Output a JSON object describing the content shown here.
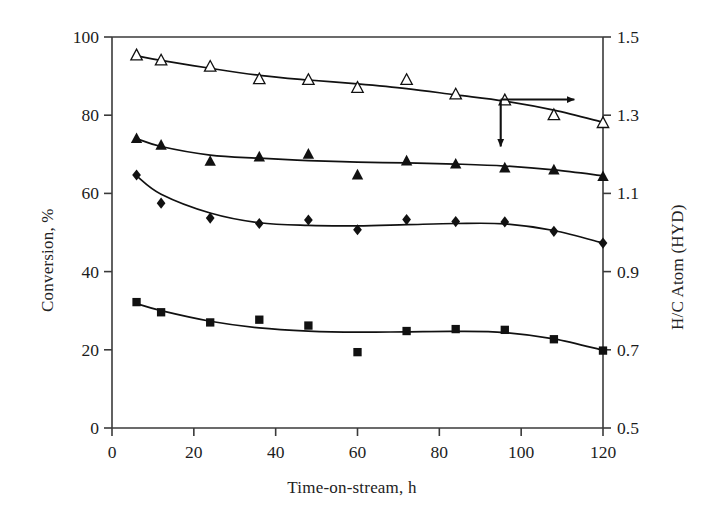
{
  "chart_data": {
    "type": "line",
    "title": "",
    "subtitle": "",
    "xlabel": "Time-on-stream, h",
    "ylabel": "Conversion, %",
    "ylabel_right": "H/C Atom (HYD)",
    "xlim": [
      0,
      120
    ],
    "ylim": [
      0,
      100
    ],
    "ylim_right": [
      0.5,
      1.5
    ],
    "xticks": [
      0,
      20,
      40,
      60,
      80,
      100,
      120
    ],
    "xticklabels": [
      "0",
      "20",
      "40",
      "60",
      "80",
      "100",
      "120"
    ],
    "yticks": [
      0,
      20,
      40,
      60,
      80,
      100
    ],
    "yticklabels": [
      "0",
      "20",
      "40",
      "60",
      "80",
      "100"
    ],
    "yticks_right": [
      0.5,
      0.7,
      0.9,
      1.1,
      1.3,
      1.5
    ],
    "yticklabels_right": [
      "0.5",
      "0.7",
      "0.9",
      "1.1",
      "1.3",
      "1.5"
    ],
    "grid": false,
    "legend": "none",
    "legend_position": "none",
    "axis_color": "#3a3a3a",
    "series_color": "#111111",
    "series": [
      {
        "name": "open-triangle",
        "marker": "triangle-open",
        "axis": "right",
        "points": [
          {
            "x": 6,
            "y": 95.3
          },
          {
            "x": 12,
            "y": 94.0
          },
          {
            "x": 24,
            "y": 92.4
          },
          {
            "x": 36,
            "y": 89.2
          },
          {
            "x": 48,
            "y": 89.0
          },
          {
            "x": 60,
            "y": 87.0
          },
          {
            "x": 72,
            "y": 89.0
          },
          {
            "x": 84,
            "y": 85.3
          },
          {
            "x": 96,
            "y": 83.8
          },
          {
            "x": 108,
            "y": 80.0
          },
          {
            "x": 120,
            "y": 78.0
          }
        ],
        "fit_curve": [
          {
            "x": 6,
            "y": 95.2
          },
          {
            "x": 12,
            "y": 94.0
          },
          {
            "x": 24,
            "y": 92.0
          },
          {
            "x": 36,
            "y": 90.2
          },
          {
            "x": 48,
            "y": 89.0
          },
          {
            "x": 60,
            "y": 88.0
          },
          {
            "x": 72,
            "y": 86.8
          },
          {
            "x": 84,
            "y": 85.2
          },
          {
            "x": 96,
            "y": 83.6
          },
          {
            "x": 108,
            "y": 81.3
          },
          {
            "x": 120,
            "y": 78.2
          }
        ]
      },
      {
        "name": "filled-triangle",
        "marker": "triangle-filled",
        "axis": "left",
        "points": [
          {
            "x": 6,
            "y": 74.0
          },
          {
            "x": 12,
            "y": 72.3
          },
          {
            "x": 24,
            "y": 68.2
          },
          {
            "x": 36,
            "y": 69.3
          },
          {
            "x": 48,
            "y": 70.0
          },
          {
            "x": 60,
            "y": 64.7
          },
          {
            "x": 72,
            "y": 68.3
          },
          {
            "x": 84,
            "y": 67.5
          },
          {
            "x": 96,
            "y": 66.5
          },
          {
            "x": 108,
            "y": 66.0
          },
          {
            "x": 120,
            "y": 64.3
          }
        ],
        "fit_curve": [
          {
            "x": 6,
            "y": 74.0
          },
          {
            "x": 12,
            "y": 72.0
          },
          {
            "x": 24,
            "y": 69.8
          },
          {
            "x": 36,
            "y": 69.0
          },
          {
            "x": 48,
            "y": 68.4
          },
          {
            "x": 60,
            "y": 68.0
          },
          {
            "x": 72,
            "y": 67.8
          },
          {
            "x": 84,
            "y": 67.5
          },
          {
            "x": 96,
            "y": 67.0
          },
          {
            "x": 108,
            "y": 66.0
          },
          {
            "x": 120,
            "y": 64.5
          }
        ]
      },
      {
        "name": "filled-diamond",
        "marker": "diamond-filled",
        "axis": "left",
        "points": [
          {
            "x": 6,
            "y": 64.7
          },
          {
            "x": 12,
            "y": 57.5
          },
          {
            "x": 24,
            "y": 53.7
          },
          {
            "x": 36,
            "y": 52.3
          },
          {
            "x": 48,
            "y": 53.2
          },
          {
            "x": 60,
            "y": 50.7
          },
          {
            "x": 72,
            "y": 53.3
          },
          {
            "x": 84,
            "y": 52.8
          },
          {
            "x": 96,
            "y": 52.7
          },
          {
            "x": 108,
            "y": 50.3
          },
          {
            "x": 120,
            "y": 47.3
          }
        ],
        "fit_curve": [
          {
            "x": 6,
            "y": 64.5
          },
          {
            "x": 12,
            "y": 59.8
          },
          {
            "x": 24,
            "y": 55.0
          },
          {
            "x": 36,
            "y": 52.5
          },
          {
            "x": 48,
            "y": 51.8
          },
          {
            "x": 60,
            "y": 51.7
          },
          {
            "x": 72,
            "y": 52.0
          },
          {
            "x": 84,
            "y": 52.3
          },
          {
            "x": 96,
            "y": 52.2
          },
          {
            "x": 108,
            "y": 50.5
          },
          {
            "x": 120,
            "y": 47.3
          }
        ]
      },
      {
        "name": "filled-square",
        "marker": "square-filled",
        "axis": "left",
        "points": [
          {
            "x": 6,
            "y": 32.2
          },
          {
            "x": 12,
            "y": 29.6
          },
          {
            "x": 24,
            "y": 27.0
          },
          {
            "x": 36,
            "y": 27.7
          },
          {
            "x": 48,
            "y": 26.2
          },
          {
            "x": 60,
            "y": 19.4
          },
          {
            "x": 72,
            "y": 24.8
          },
          {
            "x": 84,
            "y": 25.3
          },
          {
            "x": 96,
            "y": 25.1
          },
          {
            "x": 108,
            "y": 22.7
          },
          {
            "x": 120,
            "y": 19.8
          }
        ],
        "fit_curve": [
          {
            "x": 6,
            "y": 31.8
          },
          {
            "x": 12,
            "y": 30.0
          },
          {
            "x": 24,
            "y": 27.3
          },
          {
            "x": 36,
            "y": 25.6
          },
          {
            "x": 48,
            "y": 24.8
          },
          {
            "x": 60,
            "y": 24.5
          },
          {
            "x": 72,
            "y": 24.6
          },
          {
            "x": 84,
            "y": 24.7
          },
          {
            "x": 96,
            "y": 24.4
          },
          {
            "x": 108,
            "y": 22.8
          },
          {
            "x": 120,
            "y": 19.9
          }
        ]
      }
    ],
    "annotations": [
      {
        "name": "right-arrow",
        "type": "arrow",
        "direction": "right",
        "x_start": 95,
        "y_start": 84,
        "x_end": 113,
        "y_end": 84
      },
      {
        "name": "down-arrow",
        "type": "arrow",
        "direction": "down",
        "x_start": 95,
        "y_start": 84,
        "x_end": 95,
        "y_end": 72
      }
    ]
  }
}
